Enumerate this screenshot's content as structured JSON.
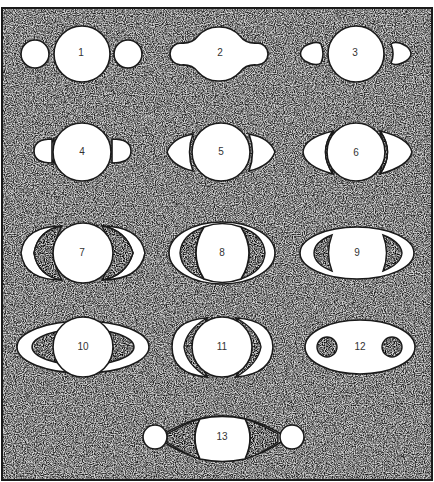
{
  "diagram": {
    "background": "stippled grey frame",
    "figures": [
      {
        "id": 1,
        "label": "1",
        "shape": "globe with two separate small round companions"
      },
      {
        "id": 2,
        "label": "2",
        "shape": "globe with attached lobed handles"
      },
      {
        "id": 3,
        "label": "3",
        "shape": "globe with two teardrop companions"
      },
      {
        "id": 4,
        "label": "4",
        "shape": "globe with two half-disc appendages"
      },
      {
        "id": 5,
        "label": "5",
        "shape": "globe with two crescent ansae"
      },
      {
        "id": 6,
        "label": "6",
        "shape": "globe with wide crescent ansae and dark gaps"
      },
      {
        "id": 7,
        "label": "7",
        "shape": "globe with open crescent arms"
      },
      {
        "id": 8,
        "label": "8",
        "shape": "globe inside elliptical ring with gaps"
      },
      {
        "id": 9,
        "label": "9",
        "shape": "flattened ellipse with two dark crescents"
      },
      {
        "id": 10,
        "label": "10",
        "shape": "globe crossing an elliptical ring"
      },
      {
        "id": 11,
        "label": "11",
        "shape": "globe with double crescent arcs"
      },
      {
        "id": 12,
        "label": "12",
        "shape": "ellipse with two dark round spots"
      },
      {
        "id": 13,
        "label": "13",
        "shape": "globe with arcs connecting two side discs"
      }
    ]
  },
  "colors": {
    "stipple_bg": "#bdbdbd",
    "outline": "#1a1a1a",
    "fill": "#ffffff",
    "label": "#333333"
  }
}
